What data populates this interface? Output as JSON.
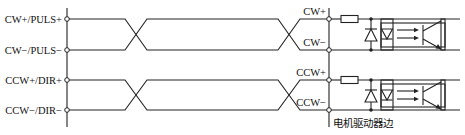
{
  "diagram": {
    "title": "",
    "left_terminals": [
      {
        "label": "CW+/PULS+",
        "y": 19
      },
      {
        "label": "CW−/PULS−",
        "y": 50
      },
      {
        "label": "CCW+/DIR+",
        "y": 80
      },
      {
        "label": "CCW−/DIR−",
        "y": 110
      }
    ],
    "right_terminals": [
      {
        "label": "CW+",
        "y": 19
      },
      {
        "label": "CW−",
        "y": 50
      },
      {
        "label": "CCW+",
        "y": 80
      },
      {
        "label": "CCW−",
        "y": 110
      }
    ],
    "side_label": "电机驱动器边",
    "components": [
      {
        "channel": "CW",
        "parts": [
          "resistor",
          "protection-diode",
          "optocoupler-led",
          "phototransistor"
        ]
      },
      {
        "channel": "CCW",
        "parts": [
          "resistor",
          "protection-diode",
          "optocoupler-led",
          "phototransistor"
        ]
      }
    ],
    "colors": {
      "line": "#222222",
      "background": "#ffffff"
    }
  }
}
